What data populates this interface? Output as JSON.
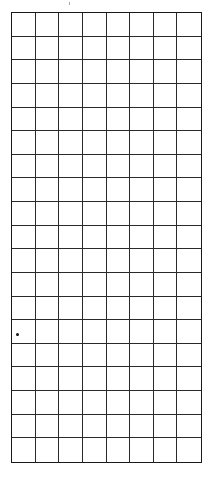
{
  "grid": {
    "rows": 19,
    "columns": 8,
    "line_color": "#2a2a2a",
    "background": "#ffffff"
  },
  "marks": [
    {
      "type": "dot",
      "x": 16,
      "y": 333
    }
  ]
}
